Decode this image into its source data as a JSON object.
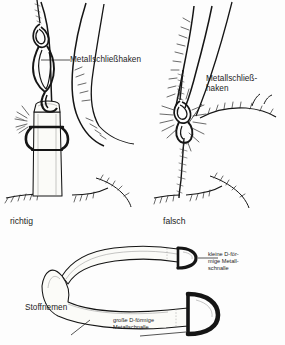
{
  "figure": {
    "kind": "instructional-line-drawing",
    "language": "de",
    "background_color": "#fdfdfd",
    "ink_color": "#151515"
  },
  "panels": [
    {
      "id": "correct",
      "caption": "richtig",
      "label": "Metallschließhaken",
      "description": "Metallschließhaken am Stoffriemen mit D-Schnalle befestigt"
    },
    {
      "id": "wrong",
      "caption": "falsch",
      "label_line1": "Metallschließ-",
      "label_line2": "haken",
      "description": "Metallschließhaken direkt am Fell befestigt"
    },
    {
      "id": "strap",
      "label_strap": "Stoffriemen",
      "label_small_ring_line1": "kleine D-för-",
      "label_small_ring_line2": "mige Metall-",
      "label_small_ring_line3": "schnalle",
      "label_large_ring_line1": "große D-förmige",
      "label_large_ring_line2": "Metallschnalle"
    }
  ]
}
